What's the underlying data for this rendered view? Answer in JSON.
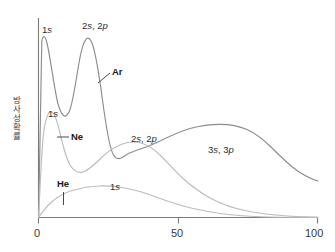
{
  "chart_data": {
    "type": "line",
    "title": "",
    "xlabel": "",
    "ylabel": "방사성 확률",
    "xlim": [
      0,
      100
    ],
    "ylim": [
      0,
      100
    ],
    "grid": false,
    "legend_position": "inline-annotations",
    "xticks": [
      "0",
      "50",
      "100"
    ],
    "xtick_values": [
      0,
      50,
      100
    ],
    "yticks": [],
    "series": [
      {
        "name": "Ar",
        "color": "#8a8a8a",
        "shell_labels": [
          "1s",
          "2s, 2p",
          "3s, 3p"
        ],
        "x": [
          0,
          1,
          2,
          3,
          4,
          5,
          6,
          8,
          10,
          12,
          14,
          16,
          18,
          20,
          22,
          24,
          25,
          26,
          27,
          28,
          30,
          32,
          34,
          36,
          38,
          40,
          45,
          50,
          55,
          60,
          65,
          70,
          75,
          80,
          85,
          90,
          95,
          100
        ],
        "values": [
          0,
          55,
          88,
          96,
          90,
          74,
          58,
          38,
          30,
          32,
          44,
          62,
          80,
          92,
          96,
          90,
          82,
          66,
          50,
          38,
          28,
          25,
          26,
          29,
          33,
          37,
          44,
          49,
          53,
          55,
          55,
          53,
          49,
          44,
          39,
          34,
          30,
          27
        ]
      },
      {
        "name": "Ne",
        "color": "#b6b6b6",
        "shell_labels": [
          "1s",
          "2s, 2p"
        ],
        "x": [
          0,
          1,
          2,
          3,
          4,
          5,
          6,
          8,
          10,
          12,
          14,
          16,
          18,
          20,
          22,
          25,
          28,
          30,
          32,
          35,
          40,
          45,
          50,
          55,
          60,
          65,
          70,
          75,
          80,
          85,
          90,
          95,
          100
        ],
        "values": [
          0,
          26,
          46,
          56,
          60,
          59,
          55,
          45,
          36,
          30,
          27,
          26,
          28,
          32,
          38,
          46,
          52,
          54,
          54,
          52,
          46,
          40,
          34,
          28,
          23,
          19,
          15,
          12,
          10,
          8,
          6,
          5,
          4
        ]
      },
      {
        "name": "He",
        "color": "#b6b6b6",
        "shell_labels": [
          "1s"
        ],
        "x": [
          0,
          2,
          5,
          8,
          12,
          16,
          20,
          25,
          30,
          35,
          40,
          45,
          50,
          55,
          60,
          65,
          70,
          75,
          80,
          85,
          90,
          95,
          100
        ],
        "values": [
          0,
          4,
          9,
          13,
          17,
          20,
          22,
          24,
          24,
          23,
          22,
          20,
          17,
          14,
          11,
          9,
          7,
          5,
          4,
          3,
          2,
          2,
          1
        ]
      }
    ],
    "annotations": [
      {
        "text": "1s",
        "series": "Ar",
        "kind": "shell"
      },
      {
        "text": "2s, 2p",
        "series": "Ar",
        "kind": "shell"
      },
      {
        "text": "3s, 3p",
        "series": "Ar",
        "kind": "shell"
      },
      {
        "text": "Ar",
        "series": "Ar",
        "kind": "series-name"
      },
      {
        "text": "1s",
        "series": "Ne",
        "kind": "shell"
      },
      {
        "text": "2s, 2p",
        "series": "Ne",
        "kind": "shell"
      },
      {
        "text": "Ne",
        "series": "Ne",
        "kind": "series-name"
      },
      {
        "text": "1s",
        "series": "He",
        "kind": "shell"
      },
      {
        "text": "He",
        "series": "He",
        "kind": "series-name"
      }
    ]
  },
  "axis": {
    "y_label": "방사성 확률",
    "y_label_chars": [
      "방",
      "사",
      "성",
      " ",
      "확",
      "률"
    ],
    "x_tick_0": "0",
    "x_tick_50": "50",
    "x_tick_100": "100"
  },
  "labels": {
    "ar_1s": "1s",
    "ar_2s2p": "2s, 2p",
    "ar_3s3p": "3s, 3p",
    "ar_name": "Ar",
    "ne_1s": "1s",
    "ne_2s2p": "2s, 2p",
    "ne_name": "Ne",
    "he_1s": "1s",
    "he_name": "He"
  },
  "colors": {
    "axis": "#6b6b6b",
    "curve_dark": "#8a8a8a",
    "curve_light": "#b6b6b6",
    "text": "#2e2e2e",
    "background": "#ffffff"
  }
}
